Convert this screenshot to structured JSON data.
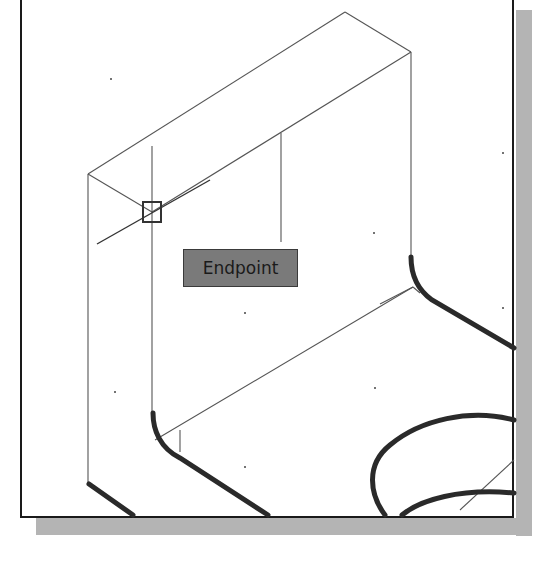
{
  "viewport": {
    "background": "#ffffff",
    "frame_color": "#1a1a1a",
    "shadow_color": "#b4b4b4"
  },
  "osnap": {
    "tooltip_label": "Endpoint",
    "tooltip_bg": "#7a7a7a",
    "marker_shape": "square-endpoint-marker",
    "marker_position": [
      152,
      212
    ]
  },
  "model": {
    "description": "Isometric wireframe of an L-shaped bracket with fillets and a circular hole",
    "thin_edge_color": "#555555",
    "thick_edge_color": "#2a2a2a"
  }
}
